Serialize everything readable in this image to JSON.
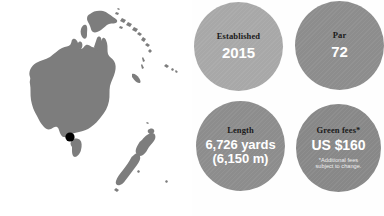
{
  "map": {
    "region_name": "Oceania",
    "landmass_color": "#7d7d7d",
    "background_color": "#ffffff",
    "marker": {
      "name": "course-location-marker",
      "color": "#000000",
      "x": 70,
      "y": 137
    },
    "landmasses": [
      "Australia",
      "Tasmania",
      "New Zealand",
      "Papua New Guinea",
      "Solomon Islands",
      "New Caledonia",
      "Fiji",
      "Vanuatu"
    ]
  },
  "stats": {
    "established": {
      "label": "Established",
      "value": "2015",
      "color": "#a8a8a8"
    },
    "par": {
      "label": "Par",
      "value": "72",
      "color": "#8d8d8d"
    },
    "length": {
      "label": "Length",
      "value_line1": "6,726 yards",
      "value_line2": "(6,150 m)",
      "color": "#8d8d8d"
    },
    "green_fees": {
      "label": "Green fees*",
      "value": "US $160",
      "note_line1": "*Additional fees",
      "note_line2": "subject to change.",
      "color": "#888888"
    }
  }
}
